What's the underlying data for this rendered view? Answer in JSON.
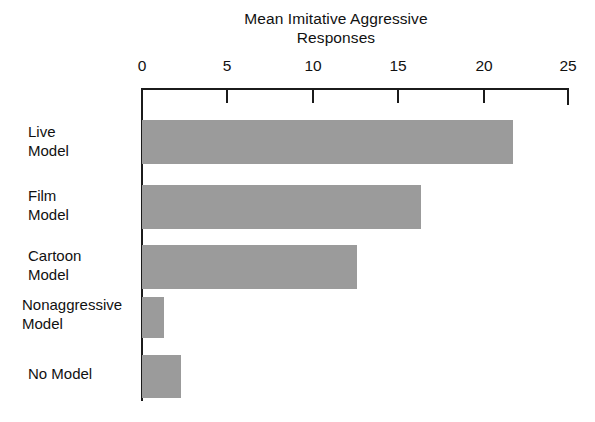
{
  "chart_data": {
    "type": "bar",
    "orientation": "horizontal",
    "title": "Mean Imitative Aggressive Responses",
    "title_lines": [
      "Mean Imitative Aggressive",
      "Responses"
    ],
    "xlabel": "",
    "ylabel": "",
    "xlim": [
      0,
      25
    ],
    "grid": false,
    "legend": "none",
    "axis_position": "top",
    "bar_color": "#9b9b9b",
    "axis_color": "#1b1b1b",
    "background_color": "#ffffff",
    "xticks": [
      0,
      5,
      10,
      15,
      20,
      25
    ],
    "xtick_labels": [
      "0",
      "5",
      "10",
      "15",
      "20",
      "25"
    ],
    "categories": [
      "Live Model",
      "Film Model",
      "Cartoon Model",
      "Nonaggressive Model",
      "No Model"
    ],
    "category_lines": [
      [
        "Live",
        "Model"
      ],
      [
        "Film",
        "Model"
      ],
      [
        "Cartoon",
        "Model"
      ],
      [
        "Nonaggressive",
        "Model"
      ],
      [
        "No Model"
      ]
    ],
    "values": [
      21.8,
      16.4,
      12.6,
      1.3,
      2.3
    ],
    "bars": [
      {
        "category": "Live Model",
        "value": 21.8
      },
      {
        "category": "Film Model",
        "value": 16.4
      },
      {
        "category": "Cartoon Model",
        "value": 12.6
      },
      {
        "category": "Nonaggressive Model",
        "value": 1.3
      },
      {
        "category": "No Model",
        "value": 2.3
      }
    ]
  }
}
